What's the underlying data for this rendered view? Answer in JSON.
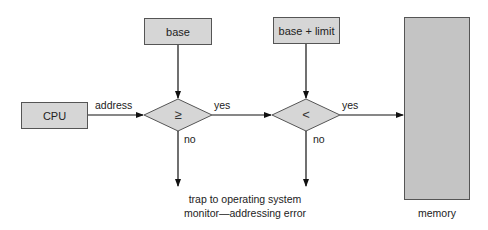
{
  "diagram": {
    "nodes": {
      "base": {
        "label": "base"
      },
      "base_limit": {
        "label": "base + limit"
      },
      "cpu": {
        "label": "CPU"
      },
      "memory": {
        "label": "memory"
      },
      "compare_ge": {
        "symbol": "≥"
      },
      "compare_lt": {
        "symbol": "<"
      }
    },
    "edges": {
      "address": "address",
      "yes1": "yes",
      "no1": "no",
      "yes2": "yes",
      "no2": "no"
    },
    "trap": {
      "line1": "trap to operating system",
      "line2": "monitor—addressing error"
    },
    "colors": {
      "box_fill": "#d6d6d6",
      "memory_fill": "#c4c4c4",
      "stroke": "#555555",
      "arrow": "#111111"
    }
  }
}
